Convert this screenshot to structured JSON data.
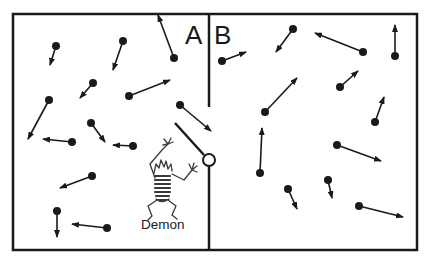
{
  "diagram": {
    "colors": {
      "ink": "#1a1a1a",
      "background": "#ffffff"
    },
    "labels": {
      "chamber_a": "A",
      "chamber_b": "B",
      "demon": "Demon"
    },
    "box": {
      "x": 13,
      "y": 14,
      "width": 404,
      "height": 236
    },
    "divider": {
      "x": 209,
      "top_end_y": 107,
      "gate_pivot": {
        "x": 209,
        "y": 160,
        "r": 6
      }
    },
    "gate": {
      "x1": 175,
      "y1": 123,
      "x2": 204,
      "y2": 155
    },
    "particles": [
      {
        "chamber": "A",
        "x": 56,
        "y": 46,
        "tx": 50,
        "ty": 65
      },
      {
        "chamber": "A",
        "x": 123,
        "y": 41,
        "tx": 113,
        "ty": 70
      },
      {
        "chamber": "A",
        "x": 174,
        "y": 58,
        "tx": 158,
        "ty": 15
      },
      {
        "chamber": "A",
        "x": 93,
        "y": 83,
        "tx": 80,
        "ty": 98
      },
      {
        "chamber": "A",
        "x": 129,
        "y": 96,
        "tx": 170,
        "ty": 80
      },
      {
        "chamber": "A",
        "x": 49,
        "y": 100,
        "tx": 28,
        "ty": 139
      },
      {
        "chamber": "A",
        "x": 180,
        "y": 105,
        "tx": 211,
        "ty": 131
      },
      {
        "chamber": "A",
        "x": 91,
        "y": 123,
        "tx": 105,
        "ty": 142
      },
      {
        "chamber": "A",
        "x": 72,
        "y": 142,
        "tx": 43,
        "ty": 139
      },
      {
        "chamber": "A",
        "x": 133,
        "y": 146,
        "tx": 113,
        "ty": 145
      },
      {
        "chamber": "A",
        "x": 92,
        "y": 176,
        "tx": 60,
        "ty": 188
      },
      {
        "chamber": "A",
        "x": 57,
        "y": 211,
        "tx": 57,
        "ty": 237
      },
      {
        "chamber": "A",
        "x": 107,
        "y": 228,
        "tx": 72,
        "ty": 224
      },
      {
        "chamber": "B",
        "x": 222,
        "y": 61,
        "tx": 246,
        "ty": 52
      },
      {
        "chamber": "B",
        "x": 293,
        "y": 29,
        "tx": 276,
        "ty": 52
      },
      {
        "chamber": "B",
        "x": 363,
        "y": 52,
        "tx": 315,
        "ty": 33
      },
      {
        "chamber": "B",
        "x": 395,
        "y": 56,
        "tx": 395,
        "ty": 25
      },
      {
        "chamber": "B",
        "x": 340,
        "y": 87,
        "tx": 358,
        "ty": 71
      },
      {
        "chamber": "B",
        "x": 265,
        "y": 112,
        "tx": 297,
        "ty": 78
      },
      {
        "chamber": "B",
        "x": 375,
        "y": 122,
        "tx": 384,
        "ty": 97
      },
      {
        "chamber": "B",
        "x": 260,
        "y": 173,
        "tx": 262,
        "ty": 128
      },
      {
        "chamber": "B",
        "x": 337,
        "y": 145,
        "tx": 381,
        "ty": 161
      },
      {
        "chamber": "B",
        "x": 288,
        "y": 189,
        "tx": 297,
        "ty": 209
      },
      {
        "chamber": "B",
        "x": 328,
        "y": 180,
        "tx": 332,
        "ty": 198
      },
      {
        "chamber": "B",
        "x": 359,
        "y": 206,
        "tx": 403,
        "ty": 217
      }
    ]
  }
}
